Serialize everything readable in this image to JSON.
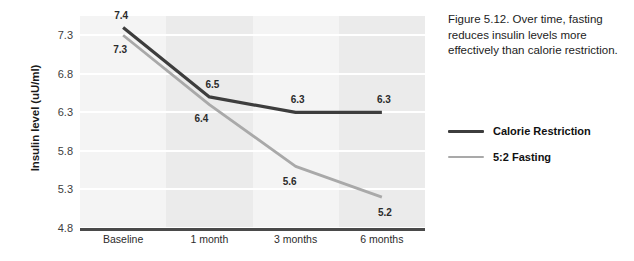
{
  "chart_data": {
    "type": "line",
    "title": "",
    "xlabel": "",
    "ylabel": "Insulin level (uU/ml)",
    "categories": [
      "Baseline",
      "1 month",
      "3 months",
      "6 months"
    ],
    "series": [
      {
        "name": "Calorie Restriction",
        "color": "#3d3d3d",
        "values": [
          7.4,
          6.5,
          6.3,
          6.3
        ],
        "labels": [
          "7.4",
          "6.5",
          "6.3",
          "6.3"
        ]
      },
      {
        "name": "5:2 Fasting",
        "color": "#a9a9a9",
        "values": [
          7.3,
          6.4,
          5.6,
          5.2
        ],
        "labels": [
          "7.3",
          "6.4",
          "5.6",
          "5.2"
        ]
      }
    ],
    "yticks": [
      "7.3",
      "6.8",
      "6.3",
      "5.8",
      "5.3",
      "4.8"
    ],
    "ytick_values": [
      7.3,
      6.8,
      6.3,
      5.8,
      5.3,
      4.8
    ],
    "ylim": [
      4.8,
      7.55
    ],
    "grid": "horizontal-white-gridlines-on-banded-background",
    "legend_position": "right"
  },
  "caption": {
    "text": "Figure 5.12. Over time, fasting reduces insulin levels more effectively than calorie restriction."
  },
  "legend": {
    "items": [
      {
        "label": "Calorie Restriction",
        "color": "#3d3d3d",
        "thickness": "3px"
      },
      {
        "label": "5:2 Fasting",
        "color": "#a9a9a9",
        "thickness": "2.5px"
      }
    ]
  },
  "colors": {
    "background": "#ffffff",
    "band_dark": "#ebebeb",
    "band_light": "#f4f4f4",
    "gridline": "#ffffff",
    "axis": "#4a4a4a",
    "text": "#1c1c1c"
  }
}
